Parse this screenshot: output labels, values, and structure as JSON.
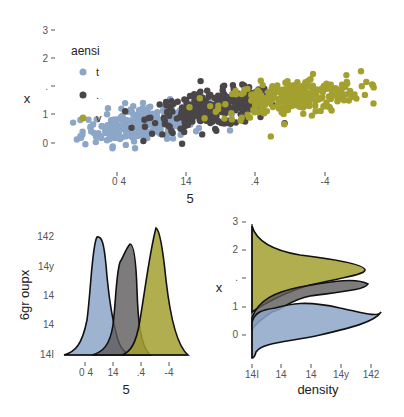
{
  "colors": {
    "t": "#8CA6C8",
    "dot": "#4A4548",
    "v": "#A3A030",
    "outline": "#111111"
  },
  "chart_data": [
    {
      "type": "scatter",
      "title": "",
      "xlabel": "5",
      "ylabel": "x",
      "x_ticks": [
        "0 4",
        "14",
        ".4",
        "-4"
      ],
      "y_ticks": [
        "3",
        "2",
        ".",
        "1",
        "0"
      ],
      "legend": {
        "title": "aensi",
        "position": "top-left inside",
        "entries": [
          {
            "label": "t",
            "color": "#8CA6C8"
          },
          {
            "label": ".",
            "color": "#4A4548"
          },
          {
            "label": "v",
            "color": "#A3A030"
          }
        ]
      },
      "series": [
        {
          "name": "t",
          "center_x": 0.9,
          "center_y": 0.7,
          "spread_x": 0.45,
          "spread_y": 0.4,
          "n": 260
        },
        {
          "name": ".",
          "center_x": 1.9,
          "center_y": 1.2,
          "spread_x": 0.45,
          "spread_y": 0.4,
          "n": 260
        },
        {
          "name": "v",
          "center_x": 3.0,
          "center_y": 1.6,
          "spread_x": 0.5,
          "spread_y": 0.4,
          "n": 260
        }
      ],
      "grid": false
    },
    {
      "type": "area",
      "title": "",
      "xlabel": "5",
      "ylabel": "6gr oupx",
      "x_ticks": [
        "0 4",
        "14",
        ".4",
        "-4"
      ],
      "y_ticks": [
        "142",
        "14y",
        "14",
        "14",
        "14I"
      ],
      "series": [
        {
          "name": "t",
          "peak_x": 0.85,
          "peak_density": 0.95
        },
        {
          "name": ".",
          "peak_x": 1.95,
          "peak_density": 0.82
        },
        {
          "name": "v",
          "peak_x": 3.0,
          "peak_density": 1.0
        }
      ],
      "orientation": "vertical density"
    },
    {
      "type": "area",
      "title": "",
      "xlabel": "density",
      "ylabel": "x",
      "x_ticks": [
        "14I",
        "14",
        "14",
        "14y",
        "142"
      ],
      "y_ticks": [
        "3",
        "2",
        ".",
        "1",
        "0"
      ],
      "series": [
        {
          "name": "t",
          "peak_y": 0.8,
          "peak_density": 1.0
        },
        {
          "name": ".",
          "peak_y": 1.7,
          "peak_density": 0.85
        },
        {
          "name": "v",
          "peak_y": 1.55,
          "peak_density": 0.8
        }
      ],
      "orientation": "horizontal density"
    }
  ]
}
